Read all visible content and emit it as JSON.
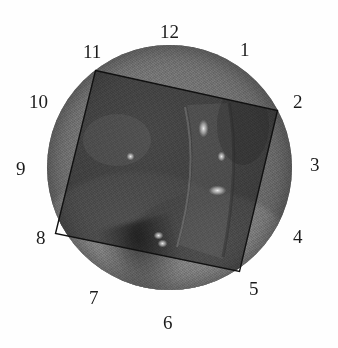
{
  "figure": {
    "background_color": "#ffffff",
    "ink_color": "#1b1b1b"
  },
  "field": {
    "shape": "circle",
    "center_x": 170,
    "center_y": 167,
    "diameter": 245,
    "fill_color": "#6f6f6f",
    "rim_color": "#585858",
    "description": "grayscale tissue image, darker inside the overlaid rectangle, lighter lobes toward the lower-left and lower-centre"
  },
  "roi": {
    "shape": "rectangle",
    "stroke_color": "#111111",
    "stroke_width": 1.4,
    "fill": "darkened",
    "corners": [
      {
        "name": "top-left",
        "x": 96,
        "y": 70
      },
      {
        "name": "top-right",
        "x": 278,
        "y": 110
      },
      {
        "name": "bottom-right",
        "x": 240,
        "y": 271
      },
      {
        "name": "bottom-left",
        "x": 56,
        "y": 233
      }
    ]
  },
  "highlights": [
    {
      "x": 204,
      "y": 128,
      "w": 5,
      "h": 9
    },
    {
      "x": 222,
      "y": 156,
      "w": 4,
      "h": 5
    },
    {
      "x": 218,
      "y": 190,
      "w": 9,
      "h": 5
    },
    {
      "x": 131,
      "y": 156,
      "w": 4,
      "h": 4
    },
    {
      "x": 159,
      "y": 235,
      "w": 5,
      "h": 4
    },
    {
      "x": 163,
      "y": 243,
      "w": 5,
      "h": 4
    },
    {
      "x": 111,
      "y": 269,
      "w": 4,
      "h": 4
    }
  ],
  "clock_labels": [
    {
      "id": "clock-label-12",
      "text": "12",
      "hour": 12,
      "x": 160,
      "y": 22
    },
    {
      "id": "clock-label-1",
      "text": "1",
      "hour": 1,
      "x": 240,
      "y": 40
    },
    {
      "id": "clock-label-2",
      "text": "2",
      "hour": 2,
      "x": 293,
      "y": 92
    },
    {
      "id": "clock-label-3",
      "text": "3",
      "hour": 3,
      "x": 310,
      "y": 155
    },
    {
      "id": "clock-label-4",
      "text": "4",
      "hour": 4,
      "x": 293,
      "y": 227
    },
    {
      "id": "clock-label-5",
      "text": "5",
      "hour": 5,
      "x": 249,
      "y": 279
    },
    {
      "id": "clock-label-6",
      "text": "6",
      "hour": 6,
      "x": 163,
      "y": 313
    },
    {
      "id": "clock-label-7",
      "text": "7",
      "hour": 7,
      "x": 89,
      "y": 288
    },
    {
      "id": "clock-label-8",
      "text": "8",
      "hour": 8,
      "x": 36,
      "y": 228
    },
    {
      "id": "clock-label-9",
      "text": "9",
      "hour": 9,
      "x": 16,
      "y": 159
    },
    {
      "id": "clock-label-10",
      "text": "10",
      "hour": 10,
      "x": 29,
      "y": 92
    },
    {
      "id": "clock-label-11",
      "text": "11",
      "hour": 11,
      "x": 83,
      "y": 42
    }
  ]
}
